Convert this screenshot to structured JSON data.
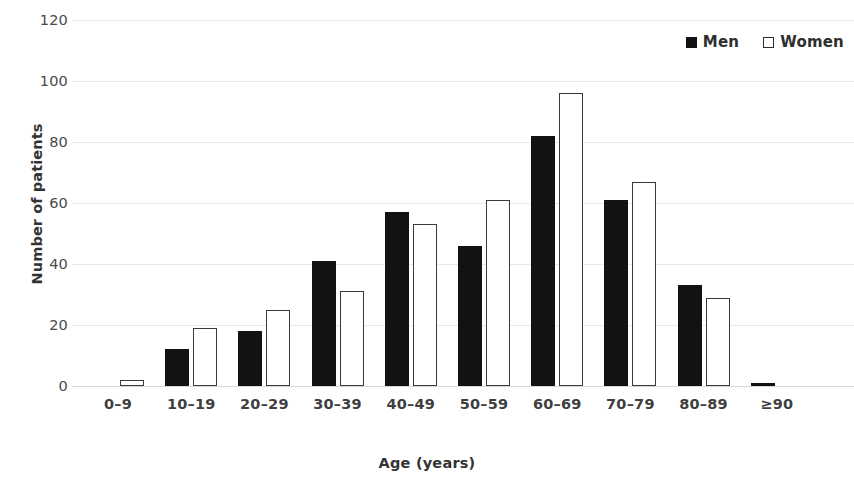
{
  "chart_data": {
    "type": "bar",
    "title": "",
    "subtitle": "",
    "xlabel": "Age (years)",
    "ylabel": "Number of patients",
    "categories": [
      "0–9",
      "10–19",
      "20–29",
      "30–39",
      "40–49",
      "50–59",
      "60–69",
      "70–79",
      "80–89",
      "≥90"
    ],
    "series": [
      {
        "name": "Men",
        "values": [
          0,
          12,
          18,
          41,
          57,
          46,
          82,
          61,
          33,
          1
        ],
        "color": "#121212",
        "style": "filled"
      },
      {
        "name": "Women",
        "values": [
          2,
          19,
          25,
          31,
          53,
          61,
          96,
          67,
          29,
          0
        ],
        "color": "#ffffff",
        "style": "hollow-black-outline"
      }
    ],
    "ylim": [
      0,
      120
    ],
    "ytick_step": 20,
    "yticks": [
      120,
      100,
      80,
      60,
      40,
      20,
      0
    ],
    "xlim_note": "categorical",
    "grid": {
      "horizontal": true,
      "vertical": false,
      "color": "#e8e8e8"
    },
    "legend": {
      "position": "top-right",
      "entries": [
        "Men",
        "Women"
      ]
    },
    "axis_line_color": "#d8d8d8",
    "background": "#ffffff"
  }
}
